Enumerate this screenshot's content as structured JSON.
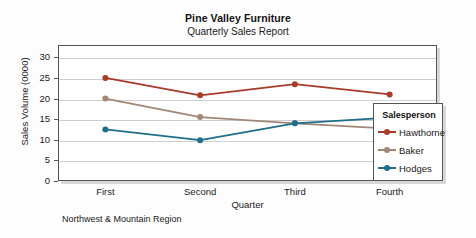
{
  "chart_data": {
    "type": "line",
    "title": "Pine Valley Furniture",
    "subtitle": "Quarterly Sales Report",
    "footnote": "Northwest & Mountain Region",
    "xlabel": "Quarter",
    "ylabel": "Sales Volume (0000)",
    "categories": [
      "First",
      "Second",
      "Third",
      "Fourth"
    ],
    "ylim": [
      0,
      33
    ],
    "yticks": [
      0,
      5,
      10,
      15,
      20,
      25,
      30
    ],
    "ytick_labels": [
      "0",
      "5",
      "10",
      "15",
      "20",
      "25",
      "30"
    ],
    "grid": true,
    "legend_position": "right-inside",
    "legend_title": "Salesperson",
    "series": [
      {
        "name": "Hawthorne",
        "color": "#a83b2a",
        "values": [
          25.0,
          20.8,
          23.5,
          21.0
        ]
      },
      {
        "name": "Baker",
        "color": "#a18776",
        "values": [
          20.0,
          15.5,
          14.0,
          12.7
        ]
      },
      {
        "name": "Hodges",
        "color": "#1e6e8c",
        "values": [
          12.5,
          9.9,
          14.0,
          15.4
        ]
      }
    ]
  }
}
